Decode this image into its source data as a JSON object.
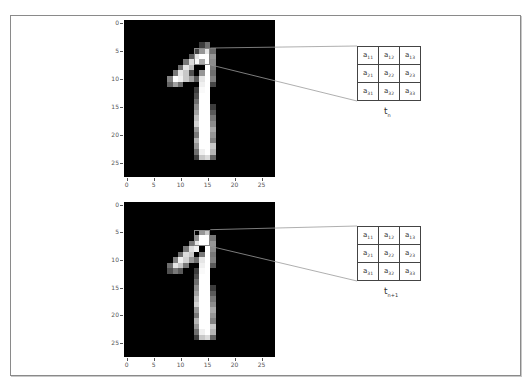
{
  "figure": {
    "border_color": "#8a8a8a",
    "background": "#ffffff"
  },
  "panels": [
    {
      "id": "top",
      "image": {
        "left": 124,
        "top": 20,
        "width": 151,
        "height": 157
      },
      "y_ticks": [
        "0",
        "5",
        "10",
        "15",
        "20",
        "25"
      ],
      "x_ticks": [
        "0",
        "5",
        "10",
        "15",
        "20",
        "25"
      ],
      "highlight": {
        "col": 13,
        "row": 5,
        "size": 3
      },
      "matrix": {
        "left": 357,
        "top": 46,
        "cells": [
          [
            {
              "base": "a",
              "sub": "11"
            },
            {
              "base": "a",
              "sub": "12"
            },
            {
              "base": "a",
              "sub": "13"
            }
          ],
          [
            {
              "base": "a",
              "sub": "21"
            },
            {
              "base": "a",
              "sub": "22"
            },
            {
              "base": "a",
              "sub": "23"
            }
          ],
          [
            {
              "base": "a",
              "sub": "31"
            },
            {
              "base": "a",
              "sub": "32"
            },
            {
              "base": "a",
              "sub": "33"
            }
          ]
        ]
      },
      "label": {
        "base": "t",
        "sub": "n",
        "left": 384,
        "top": 106
      }
    },
    {
      "id": "bottom",
      "image": {
        "left": 124,
        "top": 202,
        "width": 151,
        "height": 155
      },
      "y_ticks": [
        "0",
        "5",
        "10",
        "15",
        "20",
        "25"
      ],
      "x_ticks": [
        "0",
        "5",
        "10",
        "15",
        "20",
        "25"
      ],
      "highlight": {
        "col": 13,
        "row": 5,
        "size": 3
      },
      "matrix": {
        "left": 357,
        "top": 226,
        "cells": [
          [
            {
              "base": "a",
              "sub": "11"
            },
            {
              "base": "a",
              "sub": "12"
            },
            {
              "base": "a",
              "sub": "13"
            }
          ],
          [
            {
              "base": "a",
              "sub": "21"
            },
            {
              "base": "a",
              "sub": "22"
            },
            {
              "base": "a",
              "sub": "23"
            }
          ],
          [
            {
              "base": "a",
              "sub": "31"
            },
            {
              "base": "a",
              "sub": "32"
            },
            {
              "base": "a",
              "sub": "33"
            }
          ]
        ]
      },
      "label": {
        "base": "t",
        "sub": "n+1",
        "left": 384,
        "top": 286
      }
    }
  ],
  "digit_pixels_top": {
    "4": {
      "14": 60,
      "15": 110
    },
    "5": {
      "13": 70,
      "14": 150,
      "15": 230,
      "16": 110
    },
    "6": {
      "12": 90,
      "13": 230,
      "14": 255,
      "15": 255,
      "16": 150
    },
    "7": {
      "11": 120,
      "12": 220,
      "13": 250,
      "14": 170,
      "15": 255,
      "16": 140
    },
    "8": {
      "10": 110,
      "11": 230,
      "12": 190,
      "15": 255,
      "16": 120
    },
    "9": {
      "9": 120,
      "10": 230,
      "11": 200,
      "12": 80,
      "14": 150,
      "15": 255,
      "16": 110
    },
    "10": {
      "8": 130,
      "9": 255,
      "10": 240,
      "11": 200,
      "12": 160,
      "13": 90,
      "14": 230,
      "15": 255,
      "16": 130
    },
    "11": {
      "8": 100,
      "9": 160,
      "10": 110,
      "14": 240,
      "15": 255,
      "16": 70
    },
    "12": {
      "13": 60,
      "14": 250,
      "15": 255
    },
    "13": {
      "13": 80,
      "14": 255,
      "15": 255
    },
    "14": {
      "13": 110,
      "14": 255,
      "15": 255
    },
    "15": {
      "13": 140,
      "14": 255,
      "15": 255,
      "16": 60
    },
    "16": {
      "13": 160,
      "14": 255,
      "15": 255,
      "16": 90
    },
    "17": {
      "13": 190,
      "14": 255,
      "15": 255,
      "16": 120
    },
    "18": {
      "13": 210,
      "14": 255,
      "15": 255,
      "16": 140
    },
    "19": {
      "13": 150,
      "14": 255,
      "15": 255,
      "16": 170
    },
    "20": {
      "13": 120,
      "14": 255,
      "15": 255,
      "16": 150
    },
    "21": {
      "13": 180,
      "14": 255,
      "15": 255,
      "16": 130
    },
    "22": {
      "13": 150,
      "14": 255,
      "15": 255,
      "16": 200
    },
    "23": {
      "13": 110,
      "14": 240,
      "15": 255,
      "16": 180
    },
    "24": {
      "13": 60,
      "14": 200,
      "15": 220,
      "16": 100
    }
  },
  "digit_pixels_bottom": {
    "5": {
      "14": 150,
      "15": 200
    },
    "6": {
      "13": 140,
      "14": 255,
      "15": 255,
      "16": 120
    },
    "7": {
      "12": 120,
      "13": 230,
      "14": 255,
      "15": 255,
      "16": 150
    },
    "8": {
      "11": 120,
      "12": 220,
      "13": 240,
      "15": 255,
      "16": 140
    },
    "9": {
      "10": 110,
      "11": 220,
      "12": 200,
      "14": 120,
      "15": 255,
      "16": 120
    },
    "10": {
      "9": 130,
      "10": 240,
      "11": 210,
      "12": 150,
      "13": 110,
      "14": 230,
      "15": 255,
      "16": 130
    },
    "11": {
      "8": 110,
      "9": 230,
      "10": 200,
      "11": 120,
      "14": 240,
      "15": 255,
      "16": 90
    },
    "12": {
      "8": 80,
      "9": 120,
      "10": 90,
      "13": 60,
      "14": 250,
      "15": 255
    },
    "13": {
      "13": 80,
      "14": 255,
      "15": 255
    },
    "14": {
      "13": 110,
      "14": 255,
      "15": 255
    },
    "15": {
      "13": 140,
      "14": 255,
      "15": 255,
      "16": 60
    },
    "16": {
      "13": 160,
      "14": 255,
      "15": 255,
      "16": 90
    },
    "17": {
      "13": 190,
      "14": 255,
      "15": 255,
      "16": 120
    },
    "18": {
      "13": 210,
      "14": 255,
      "15": 255,
      "16": 140
    },
    "19": {
      "13": 150,
      "14": 255,
      "15": 255,
      "16": 170
    },
    "20": {
      "13": 120,
      "14": 255,
      "15": 255,
      "16": 150
    },
    "21": {
      "13": 180,
      "14": 255,
      "15": 255,
      "16": 130
    },
    "22": {
      "13": 150,
      "14": 255,
      "15": 255,
      "16": 200
    },
    "23": {
      "13": 110,
      "14": 240,
      "15": 255,
      "16": 180
    },
    "24": {
      "13": 60,
      "14": 200,
      "15": 220,
      "16": 100
    }
  }
}
